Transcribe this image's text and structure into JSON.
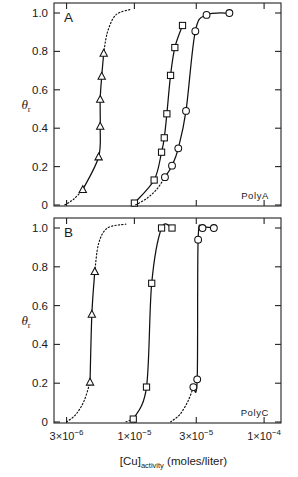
{
  "figure": {
    "axis_title_main": "[Cu]",
    "axis_title_sub": "activity",
    "axis_title_units": "(moles/liter)",
    "y_axis_symbol": "θ",
    "y_axis_sub": "r",
    "ink_color": "#111111",
    "background_color": "#ffffff"
  },
  "panels": [
    {
      "letter": "A",
      "corner_label": "PolyA",
      "y_ticks": [
        "1.0",
        "0.8",
        "0.6",
        "0.4",
        "0.2",
        "0"
      ]
    },
    {
      "letter": "B",
      "corner_label": "PolyC",
      "y_ticks": [
        "1.0",
        "0.8",
        "0.6",
        "0.4",
        "0.2",
        "0"
      ]
    }
  ],
  "x_ticks": [
    {
      "mantissa": "3",
      "times": "×",
      "base": "10",
      "exponent": "−6",
      "value": 3e-06
    },
    {
      "mantissa": "1",
      "times": "×",
      "base": "10",
      "exponent": "−5",
      "value": 1e-05
    },
    {
      "mantissa": "3",
      "times": "×",
      "base": "10",
      "exponent": "−5",
      "value": 3e-05
    },
    {
      "mantissa": "1",
      "times": "×",
      "base": "10",
      "exponent": "−4",
      "value": 0.0001
    }
  ],
  "chart_data": {
    "type": "line",
    "title": "",
    "xlabel": "[Cu]activity (moles/liter)",
    "ylabel": "θr",
    "xscale": "log",
    "xlim": [
      2.4e-06,
      0.000135
    ],
    "ylim": [
      0,
      1.05
    ],
    "grid": false,
    "legend": "none",
    "panels": [
      {
        "name": "A",
        "annotation": "PolyA",
        "series": [
          {
            "name": "triangles",
            "marker": "triangle",
            "points": [
              {
                "x": 4e-06,
                "y": 0.08
              },
              {
                "x": 5.3e-06,
                "y": 0.25
              },
              {
                "x": 5.45e-06,
                "y": 0.41
              },
              {
                "x": 5.45e-06,
                "y": 0.55
              },
              {
                "x": 5.6e-06,
                "y": 0.67
              },
              {
                "x": 5.8e-06,
                "y": 0.79
              }
            ],
            "dotted_extension": [
              {
                "x": 2.9e-06,
                "y": 0.0
              },
              {
                "x": 3.4e-06,
                "y": 0.03
              },
              {
                "x": 4e-06,
                "y": 0.08
              },
              {
                "x": 6.2e-06,
                "y": 0.9
              },
              {
                "x": 7.2e-06,
                "y": 0.99
              },
              {
                "x": 9.5e-06,
                "y": 1.02
              }
            ]
          },
          {
            "name": "squares",
            "marker": "square",
            "points": [
              {
                "x": 1e-05,
                "y": 0.01
              },
              {
                "x": 1.42e-05,
                "y": 0.13
              },
              {
                "x": 1.62e-05,
                "y": 0.275
              },
              {
                "x": 1.7e-05,
                "y": 0.35
              },
              {
                "x": 1.78e-05,
                "y": 0.475
              },
              {
                "x": 1.9e-05,
                "y": 0.675
              },
              {
                "x": 2.05e-05,
                "y": 0.82
              },
              {
                "x": 2.35e-05,
                "y": 0.935
              }
            ],
            "dotted_extension": []
          },
          {
            "name": "circles",
            "marker": "circle",
            "points": [
              {
                "x": 1.72e-05,
                "y": 0.145
              },
              {
                "x": 1.95e-05,
                "y": 0.205
              },
              {
                "x": 2.18e-05,
                "y": 0.295
              },
              {
                "x": 2.5e-05,
                "y": 0.49
              },
              {
                "x": 2.95e-05,
                "y": 0.905
              },
              {
                "x": 3.6e-05,
                "y": 0.99
              },
              {
                "x": 5.4e-05,
                "y": 1.0
              }
            ],
            "dotted_extension": [
              {
                "x": 1.02e-05,
                "y": 0.0
              },
              {
                "x": 1.25e-05,
                "y": 0.035
              },
              {
                "x": 1.5e-05,
                "y": 0.085
              },
              {
                "x": 1.72e-05,
                "y": 0.145
              },
              {
                "x": 2.7e-05,
                "y": 0.93
              },
              {
                "x": 3.3e-05,
                "y": 1.0
              }
            ]
          }
        ]
      },
      {
        "name": "B",
        "annotation": "PolyC",
        "series": [
          {
            "name": "triangles",
            "marker": "triangle",
            "points": [
              {
                "x": 4.55e-06,
                "y": 0.205
              },
              {
                "x": 4.7e-06,
                "y": 0.555
              },
              {
                "x": 4.95e-06,
                "y": 0.775
              }
            ],
            "dotted_extension": [
              {
                "x": 3e-06,
                "y": 0.0
              },
              {
                "x": 3.55e-06,
                "y": 0.04
              },
              {
                "x": 4.1e-06,
                "y": 0.11
              },
              {
                "x": 4.55e-06,
                "y": 0.205
              },
              {
                "x": 5.3e-06,
                "y": 0.92
              },
              {
                "x": 6.2e-06,
                "y": 1.0
              },
              {
                "x": 8.6e-06,
                "y": 1.02
              }
            ]
          },
          {
            "name": "squares",
            "marker": "square",
            "points": [
              {
                "x": 9.8e-06,
                "y": 0.015
              },
              {
                "x": 1.24e-05,
                "y": 0.18
              },
              {
                "x": 1.36e-05,
                "y": 0.715
              },
              {
                "x": 1.62e-05,
                "y": 1.0
              },
              {
                "x": 1.95e-05,
                "y": 1.0
              }
            ],
            "dotted_extension": [
              {
                "x": 8.6e-06,
                "y": 0.0
              },
              {
                "x": 9.8e-06,
                "y": 0.015
              }
            ]
          },
          {
            "name": "circles",
            "marker": "circle",
            "points": [
              {
                "x": 2.85e-05,
                "y": 0.18
              },
              {
                "x": 3.05e-05,
                "y": 0.22
              },
              {
                "x": 3.1e-05,
                "y": 0.94
              },
              {
                "x": 3.35e-05,
                "y": 1.0
              },
              {
                "x": 4.1e-05,
                "y": 1.0
              }
            ],
            "dotted_extension": [
              {
                "x": 1.9e-05,
                "y": 0.0
              },
              {
                "x": 2.25e-05,
                "y": 0.04
              },
              {
                "x": 2.6e-05,
                "y": 0.11
              },
              {
                "x": 2.85e-05,
                "y": 0.18
              }
            ]
          }
        ]
      }
    ]
  }
}
